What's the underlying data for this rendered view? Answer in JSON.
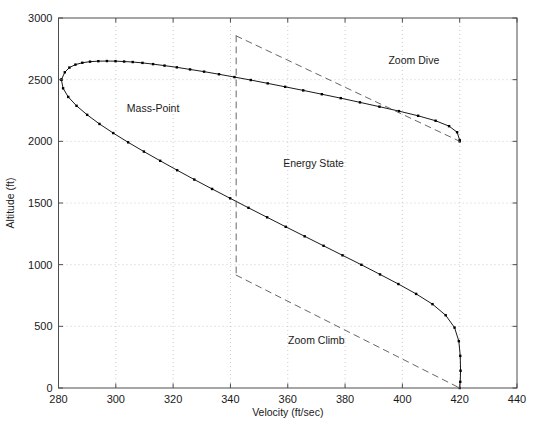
{
  "chart_data": {
    "type": "line",
    "title": "",
    "xlabel": "Velocity (ft/sec)",
    "ylabel": "Altitude (ft)",
    "xlim": [
      280,
      440
    ],
    "ylim": [
      0,
      3000
    ],
    "xticks": [
      280,
      300,
      320,
      340,
      360,
      380,
      400,
      420,
      440
    ],
    "yticks": [
      0,
      500,
      1000,
      1500,
      2000,
      2500,
      3000
    ],
    "grid": true,
    "grid_style": "dotted",
    "grid_color": "#bfbfbf",
    "legend": "none",
    "line_color": "#000000",
    "marker": "dot",
    "series": [
      {
        "name": "Mass-Point upper branch",
        "style": "solid-with-markers",
        "points": [
          [
            281.0,
            2500
          ],
          [
            282.2,
            2560
          ],
          [
            283.8,
            2598
          ],
          [
            285.9,
            2622
          ],
          [
            288.3,
            2637
          ],
          [
            291.0,
            2646
          ],
          [
            293.9,
            2650
          ],
          [
            296.9,
            2651
          ],
          [
            299.9,
            2650
          ],
          [
            302.9,
            2647
          ],
          [
            305.9,
            2643
          ],
          [
            309.3,
            2636
          ],
          [
            313.0,
            2626
          ],
          [
            317.0,
            2614
          ],
          [
            321.3,
            2600
          ],
          [
            325.9,
            2583
          ],
          [
            330.8,
            2565
          ],
          [
            336.0,
            2544
          ],
          [
            341.4,
            2521
          ],
          [
            347.1,
            2497
          ],
          [
            353.0,
            2470
          ],
          [
            359.1,
            2442
          ],
          [
            365.4,
            2413
          ],
          [
            371.9,
            2382
          ],
          [
            378.5,
            2350
          ],
          [
            385.2,
            2316
          ],
          [
            392.0,
            2281
          ],
          [
            398.8,
            2245
          ],
          [
            405.5,
            2207
          ],
          [
            411.6,
            2167
          ],
          [
            416.3,
            2123
          ],
          [
            419.1,
            2074
          ],
          [
            420.0,
            2010
          ],
          [
            420.0,
            2000
          ]
        ]
      },
      {
        "name": "Mass-Point lower branch",
        "style": "solid-with-markers",
        "points": [
          [
            281.0,
            2500
          ],
          [
            281.6,
            2430
          ],
          [
            283.4,
            2360
          ],
          [
            286.3,
            2288
          ],
          [
            290.0,
            2215
          ],
          [
            294.3,
            2141
          ],
          [
            299.1,
            2067
          ],
          [
            304.3,
            1992
          ],
          [
            309.8,
            1917
          ],
          [
            315.5,
            1842
          ],
          [
            321.4,
            1766
          ],
          [
            327.4,
            1690
          ],
          [
            333.6,
            1614
          ],
          [
            339.9,
            1538
          ],
          [
            346.3,
            1461
          ],
          [
            352.8,
            1384
          ],
          [
            359.3,
            1307
          ],
          [
            365.9,
            1230
          ],
          [
            372.5,
            1153
          ],
          [
            379.1,
            1076
          ],
          [
            385.7,
            999
          ],
          [
            392.2,
            921
          ],
          [
            398.6,
            843
          ],
          [
            404.8,
            763
          ],
          [
            410.5,
            680
          ],
          [
            415.1,
            590
          ],
          [
            418.2,
            490
          ],
          [
            419.7,
            380
          ],
          [
            420.2,
            260
          ],
          [
            420.3,
            140
          ],
          [
            420.2,
            50
          ],
          [
            420.0,
            0
          ]
        ]
      },
      {
        "name": "Energy State zoom dive boundary",
        "style": "dashed",
        "points": [
          [
            342.0,
            2855
          ],
          [
            420.0,
            2000
          ]
        ]
      },
      {
        "name": "Energy State vertical boundary",
        "style": "dashed",
        "points": [
          [
            342.0,
            2855
          ],
          [
            342.0,
            915
          ]
        ]
      },
      {
        "name": "Energy State zoom climb boundary",
        "style": "dashed",
        "points": [
          [
            342.0,
            915
          ],
          [
            420.0,
            0
          ]
        ]
      }
    ],
    "annotations": [
      {
        "text": "Mass-Point",
        "x": 313.0,
        "y": 2235
      },
      {
        "text": "Zoom Dive",
        "x": 404.0,
        "y": 2625
      },
      {
        "text": "Energy State",
        "x": 369.0,
        "y": 1790
      },
      {
        "text": "Zoom Climb",
        "x": 370.0,
        "y": 355
      }
    ]
  }
}
